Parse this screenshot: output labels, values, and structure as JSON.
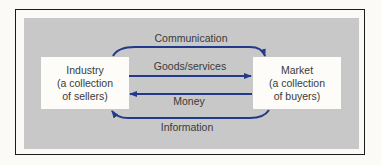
{
  "diagram": {
    "type": "flow",
    "nodes": [
      {
        "id": "industry",
        "lines": [
          "Industry",
          "(a collection",
          "of sellers)"
        ]
      },
      {
        "id": "market",
        "lines": [
          "Market",
          "(a collection",
          "of buyers)"
        ]
      }
    ],
    "edges": [
      {
        "id": "communication",
        "label": "Communication",
        "from": "industry",
        "to": "market",
        "style": "curved-top"
      },
      {
        "id": "goods",
        "label": "Goods/services",
        "from": "industry",
        "to": "market",
        "style": "straight"
      },
      {
        "id": "money",
        "label": "Money",
        "from": "market",
        "to": "industry",
        "style": "straight"
      },
      {
        "id": "information",
        "label": "Information",
        "from": "market",
        "to": "industry",
        "style": "curved-bottom"
      }
    ],
    "colors": {
      "arrow": "#23398a",
      "panel": "#c8c8c8",
      "box": "#fdfcf8",
      "border": "#1c1c1c",
      "text": "#3a3a3a"
    }
  }
}
